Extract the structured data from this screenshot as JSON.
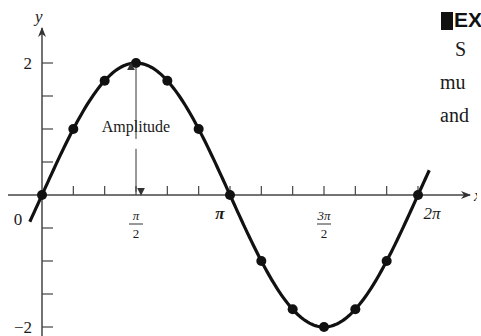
{
  "chart_data": {
    "type": "line",
    "title": "",
    "function": "y = 2 sin x",
    "xlabel": "x",
    "ylabel": "y",
    "xlim": [
      -0.07,
      2.1
    ],
    "ylim": [
      -2,
      2
    ],
    "x_unit": "pi",
    "x_tick_step_pi": 0.1667,
    "y_tick_step": 0.5,
    "x_tick_labels": [
      {
        "value_pi": 0,
        "text": "0",
        "type": "plain"
      },
      {
        "value_pi": 0.5,
        "num": "π",
        "den": "2",
        "type": "frac"
      },
      {
        "value_pi": 1,
        "text": "π",
        "type": "pi"
      },
      {
        "value_pi": 1.5,
        "num": "3π",
        "den": "2",
        "type": "frac"
      },
      {
        "value_pi": 2,
        "text": "2π",
        "type": "plain"
      }
    ],
    "y_tick_labels": [
      {
        "value": 2,
        "text": "2"
      },
      {
        "value": -2,
        "text": "−2"
      }
    ],
    "points": [
      {
        "x_pi": 0.0,
        "y": 0
      },
      {
        "x_pi": 0.1667,
        "y": 1.0
      },
      {
        "x_pi": 0.3333,
        "y": 1.732
      },
      {
        "x_pi": 0.5,
        "y": 2.0
      },
      {
        "x_pi": 0.6667,
        "y": 1.732
      },
      {
        "x_pi": 0.8333,
        "y": 1.0
      },
      {
        "x_pi": 1.0,
        "y": 0
      },
      {
        "x_pi": 1.1667,
        "y": -1.0
      },
      {
        "x_pi": 1.3333,
        "y": -1.732
      },
      {
        "x_pi": 1.5,
        "y": -2.0
      },
      {
        "x_pi": 1.6667,
        "y": -1.732
      },
      {
        "x_pi": 1.8333,
        "y": -1.0
      },
      {
        "x_pi": 2.0,
        "y": 0
      }
    ],
    "curve_range_pi": [
      -0.065,
      2.06
    ],
    "annotations": [
      {
        "text": "Amplitude",
        "x_pi": 0.5,
        "y": 1.03,
        "arrow_from": 0.85,
        "arrow_to_top": 1.95,
        "arrow_from_low": 0.7,
        "arrow_to_bottom": 0.05
      }
    ],
    "grid": false,
    "legend": "none",
    "colors": {
      "line": "#111111",
      "axis": "#444444",
      "text": "#1a1a1a"
    }
  },
  "side_text": {
    "header": "EX",
    "line1": "S",
    "line2": "mu",
    "line3": "and"
  }
}
